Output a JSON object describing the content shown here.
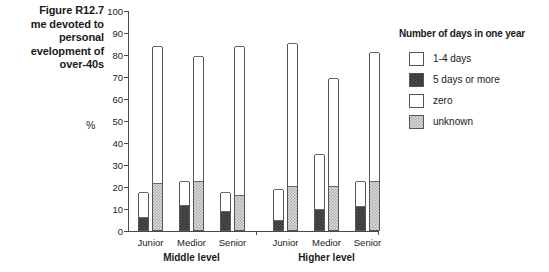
{
  "figure": {
    "number": "Figure R12.7",
    "caption_lines": "Figure R12.7\nme devoted to\npersonal\nevelopment of\nover-40s"
  },
  "legend": {
    "title": "Number of days in one year",
    "items": [
      {
        "label": "1-4 days",
        "swatch": "white",
        "color": "#ffffff"
      },
      {
        "label": "5 days or more",
        "swatch": "dark",
        "color": "#4d4d4d"
      },
      {
        "label": "zero",
        "swatch": "white",
        "color": "#ffffff"
      },
      {
        "label": "unknown",
        "swatch": "light",
        "color": "#d9d9d9"
      }
    ]
  },
  "axis": {
    "y_title": "%",
    "y_ticks": [
      "0",
      "10",
      "20",
      "30",
      "40",
      "50",
      "60",
      "70",
      "80",
      "90",
      "100"
    ]
  },
  "groups": [
    {
      "label": "Middle level",
      "categories": [
        "Junior",
        "Medior",
        "Senior"
      ]
    },
    {
      "label": "Higher level",
      "categories": [
        "Junior",
        "Medior",
        "Senior"
      ]
    }
  ],
  "chart_data": {
    "type": "bar",
    "xlabel": "",
    "ylabel": "%",
    "ylim": [
      0,
      100
    ],
    "ytick_step": 10,
    "grid": false,
    "legend_position": "right",
    "legend_title": "Number of days in one year",
    "group_labels": [
      "Middle level",
      "Higher level"
    ],
    "categories": [
      "Middle level / Junior",
      "Middle level / Medior",
      "Middle level / Senior",
      "Higher level / Junior",
      "Higher level / Medior",
      "Higher level / Senior"
    ],
    "series": [
      {
        "name": "5 days or more",
        "bar": 1,
        "stack_order": 1,
        "values": [
          6,
          11.5,
          8.5,
          4.5,
          9.5,
          11
        ]
      },
      {
        "name": "zero",
        "bar": 1,
        "stack_order": 2,
        "values": [
          17.5,
          22.5,
          17.5,
          18.5,
          34.5,
          22.5
        ]
      },
      {
        "name": "unknown",
        "bar": 2,
        "stack_order": 1,
        "values": [
          21.5,
          22.5,
          16,
          20,
          20,
          22.5
        ]
      },
      {
        "name": "1-4 days",
        "bar": 2,
        "stack_order": 2,
        "values": [
          83.5,
          79,
          83.5,
          85,
          69,
          81
        ]
      }
    ]
  }
}
